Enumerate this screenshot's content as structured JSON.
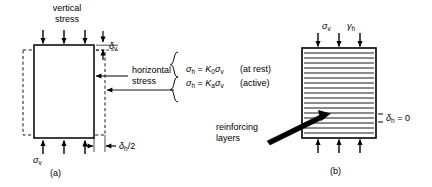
{
  "figure": {
    "width": 432,
    "height": 187,
    "background": "#ffffff",
    "ink_color": "#000000"
  },
  "panel_a": {
    "caption": "(a)",
    "labels": {
      "vertical_stress_line1": "vertical",
      "vertical_stress_line2": "stress",
      "horizontal_stress_line1": "horizontal",
      "horizontal_stress_line2": "stress",
      "delta_v": "δ",
      "delta_v_sub": "v",
      "sigma_v": "σ",
      "sigma_v_sub": "v",
      "delta_h_half": "δ",
      "delta_h_half_sub": "h",
      "delta_h_half_tail": "/2"
    },
    "geometry": {
      "solid_box": {
        "x": 34,
        "y": 45,
        "w": 60,
        "h": 93
      },
      "dashed_box": {
        "x": 23,
        "y": 50,
        "w": 82,
        "h": 85
      },
      "top_arrow_count": 3,
      "bottom_arrow_count": 3
    }
  },
  "equations": {
    "brace": "{",
    "line1": {
      "sigma": "σ",
      "sigma_sub": "h",
      "eq": " = ",
      "K": "K",
      "K_sub": "0",
      "sigma2": "σ",
      "sigma2_sub": "v",
      "note": "(at rest)"
    },
    "line2": {
      "sigma": "σ",
      "sigma_sub": "h",
      "eq": " = ",
      "K": "K",
      "K_sub": "a",
      "sigma2": "σ",
      "sigma2_sub": "v",
      "note": "(active)"
    }
  },
  "panel_b": {
    "caption": "(b)",
    "labels": {
      "sigma_v": "σ",
      "sigma_v_sub": "v",
      "gamma_h": "γ",
      "gamma_h_sub": "h",
      "reinforcing_line1": "reinforcing",
      "reinforcing_line2": "layers",
      "delta_h_zero": "δ",
      "delta_h_zero_sub": "h",
      "delta_h_zero_tail": " = 0"
    },
    "geometry": {
      "box": {
        "x": 302,
        "y": 48,
        "w": 74,
        "h": 90
      },
      "reinforcing_layer_count": 17,
      "top_arrow_count": 3,
      "bottom_arrow_count": 3
    }
  }
}
